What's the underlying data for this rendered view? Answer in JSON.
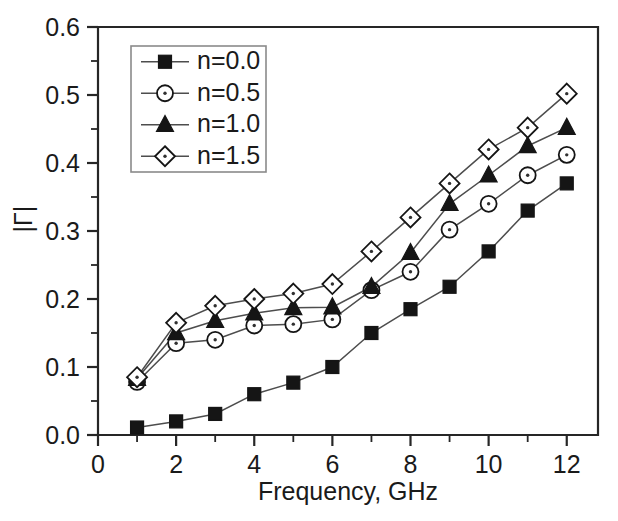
{
  "chart_data": {
    "type": "line",
    "title": "",
    "xlabel": "Frequency, GHz",
    "ylabel": "|Γ|",
    "xlim": [
      0,
      12.8
    ],
    "ylim": [
      0.0,
      0.6
    ],
    "xticks": [
      "0",
      "2",
      "4",
      "6",
      "8",
      "10",
      "12"
    ],
    "xtick_values": [
      0,
      2,
      4,
      6,
      8,
      10,
      12
    ],
    "yticks": [
      "0.0",
      "0.1",
      "0.2",
      "0.3",
      "0.4",
      "0.5",
      "0.6"
    ],
    "ytick_values": [
      0.0,
      0.1,
      0.2,
      0.3,
      0.4,
      0.5,
      0.6
    ],
    "x_minor_step": 1,
    "y_minor_step": 0.05,
    "grid": false,
    "legend_position": "upper left inside",
    "x": [
      1,
      2,
      3,
      4,
      5,
      6,
      7,
      8,
      9,
      10,
      11,
      12
    ],
    "series": [
      {
        "name": "n=0.0",
        "marker": "filled-square",
        "values": [
          0.011,
          0.02,
          0.031,
          0.06,
          0.077,
          0.1,
          0.15,
          0.185,
          0.218,
          0.27,
          0.33,
          0.37
        ]
      },
      {
        "name": "n=0.5",
        "marker": "open-circle",
        "values": [
          0.078,
          0.135,
          0.14,
          0.161,
          0.163,
          0.17,
          0.213,
          0.24,
          0.302,
          0.34,
          0.382,
          0.412
        ]
      },
      {
        "name": "n=1.0",
        "marker": "filled-triangle",
        "values": [
          0.083,
          0.15,
          0.168,
          0.179,
          0.187,
          0.188,
          0.218,
          0.268,
          0.34,
          0.382,
          0.425,
          0.452
        ]
      },
      {
        "name": "n=1.5",
        "marker": "open-diamond",
        "values": [
          0.085,
          0.165,
          0.19,
          0.2,
          0.208,
          0.222,
          0.27,
          0.32,
          0.37,
          0.42,
          0.452,
          0.502
        ]
      }
    ]
  },
  "legend": {
    "entries": [
      {
        "label": "n=0.0"
      },
      {
        "label": "n=0.5"
      },
      {
        "label": "n=1.0"
      },
      {
        "label": "n=1.5"
      }
    ]
  },
  "colors": {
    "axis": "#262626",
    "line": "#4d4d4d",
    "marker_fill": "#151515",
    "marker_open_fill": "#ffffff",
    "legend_border": "#8a8a8a",
    "background": "#ffffff"
  }
}
